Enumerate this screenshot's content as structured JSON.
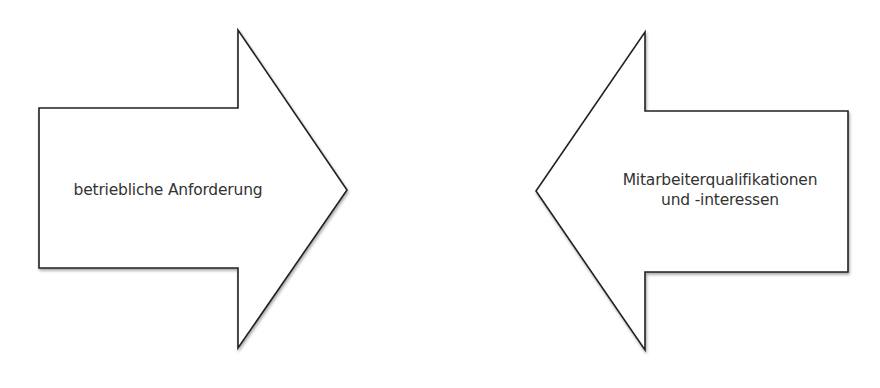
{
  "diagram": {
    "arrows": [
      {
        "id": "left-arrow",
        "direction": "right",
        "label_lines": [
          "betriebliche Anforderung"
        ]
      },
      {
        "id": "right-arrow",
        "direction": "left",
        "label_lines": [
          "Mitarbeiterqualifikationen",
          "und -interessen"
        ]
      }
    ],
    "colors": {
      "stroke": "#222222",
      "fill": "#ffffff",
      "text": "#333333",
      "shadow": "#bbbbbb"
    }
  }
}
